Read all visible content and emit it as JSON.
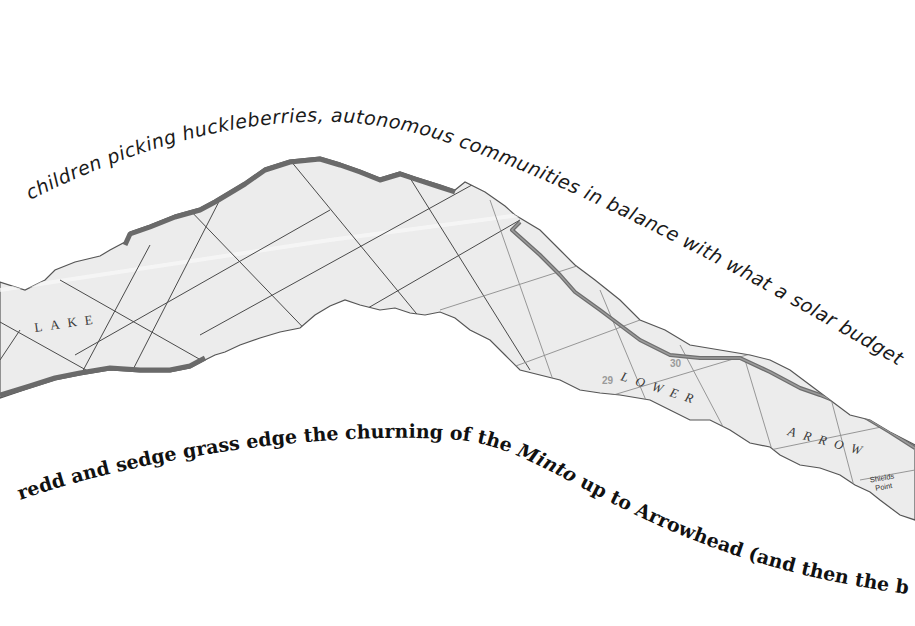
{
  "poem": {
    "top_line": "children picking huckleberries, autonomous communities in balance with what a solar budget provides,",
    "bottom_line_parts": [
      {
        "text": "redd and sedge grass edge the churning of the ",
        "italic": false
      },
      {
        "text": "Minto",
        "italic": true
      },
      {
        "text": " up to Arrowhead (and then the burning too) yeh! ain’t",
        "italic": false
      }
    ]
  },
  "map": {
    "labels": {
      "lake": "LAKE",
      "lower": "LOWER",
      "arrow": "ARROW",
      "place_line1": "Shields",
      "place_line2": "Point"
    },
    "grid_numbers": [
      "29",
      "30"
    ],
    "colors": {
      "paper": "#ececec",
      "grid": "#4a4a4a",
      "grid_light": "#8a8a8a",
      "torn_edge": "#6e6e6e",
      "road": "#707070",
      "text": "#1a1a1a"
    }
  }
}
